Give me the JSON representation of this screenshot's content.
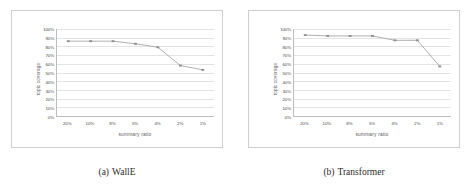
{
  "figure": {
    "background": "#ffffff",
    "panel_border_color": "#cfcfcf",
    "axis_color": "#bdbdbd",
    "grid_color": "#e3e3e3",
    "series_color": "#a6a6a6",
    "marker_color": "#8f8f8f"
  },
  "panels": [
    {
      "caption_tag": "(a)",
      "caption_text": "WallE",
      "chart_data": {
        "type": "line",
        "title": "",
        "xlabel": "summary ratio",
        "ylabel": "topic coverage",
        "categories": [
          "20%",
          "10%",
          "8%",
          "5%",
          "4%",
          "2%",
          "1%"
        ],
        "x_tick_labels": [
          "20%",
          "10%",
          "8%",
          "5%",
          "4%",
          "2%",
          "1%"
        ],
        "y_tick_labels": [
          "100%",
          "90%",
          "80%",
          "70%",
          "60%",
          "50%",
          "40%",
          "30%",
          "20%",
          "10%",
          "0%"
        ],
        "y_tick_values": [
          100,
          90,
          80,
          70,
          60,
          50,
          40,
          30,
          20,
          10,
          0
        ],
        "ylim": [
          0,
          100
        ],
        "grid": true,
        "legend": "none",
        "series": [
          {
            "name": "topic coverage",
            "values": [
              86,
              86,
              86,
              83,
              79,
              58,
              53
            ]
          }
        ]
      }
    },
    {
      "caption_tag": "(b)",
      "caption_text": "Transformer",
      "chart_data": {
        "type": "line",
        "title": "",
        "xlabel": "summary ratio",
        "ylabel": "topic coverage",
        "categories": [
          "20%",
          "10%",
          "8%",
          "5%",
          "4%",
          "2%",
          "1%"
        ],
        "x_tick_labels": [
          "20%",
          "10%",
          "8%",
          "5%",
          "4%",
          "2%",
          "1%"
        ],
        "y_tick_labels": [
          "100%",
          "90%",
          "80%",
          "70%",
          "60%",
          "50%",
          "40%",
          "30%",
          "20%",
          "10%",
          "0%"
        ],
        "y_tick_values": [
          100,
          90,
          80,
          70,
          60,
          50,
          40,
          30,
          20,
          10,
          0
        ],
        "ylim": [
          0,
          100
        ],
        "grid": true,
        "legend": "none",
        "series": [
          {
            "name": "topic coverage",
            "values": [
              93,
              92,
              92,
              92,
              87,
              87,
              57
            ]
          }
        ]
      }
    }
  ]
}
